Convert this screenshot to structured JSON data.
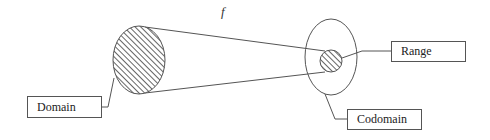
{
  "diagram": {
    "function_label": "f",
    "labels": {
      "domain": "Domain",
      "range": "Range",
      "codomain": "Codomain"
    },
    "colors": {
      "stroke": "#555555",
      "hatch": "#666666",
      "background": "#ffffff"
    },
    "shapes": {
      "domain_set": {
        "cx": 139,
        "cy": 60,
        "rx": 26,
        "ry": 34,
        "fill": "hatched"
      },
      "codomain_set": {
        "cx": 331,
        "cy": 57,
        "rx": 26,
        "ry": 38,
        "fill": "none"
      },
      "range_set": {
        "cx": 331,
        "cy": 61,
        "r": 11,
        "fill": "hatched"
      }
    }
  }
}
